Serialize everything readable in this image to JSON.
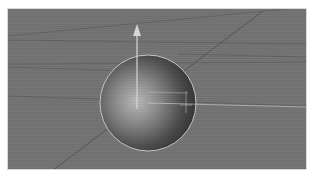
{
  "viewport": {
    "label": "3D Perspective Viewport",
    "background_color": "#737373",
    "grid_line_color": "#5f5f5f",
    "object": {
      "type": "sphere",
      "label": "Sphere",
      "center": [
        140,
        94
      ],
      "radius": 48,
      "highlight_color": "#b9b9b9",
      "shadow_color": "#3a3a3a",
      "outline_color": "#c8c8c8"
    },
    "gizmo": {
      "y_axis_color": "#d9d9d9",
      "x_axis_color": "#cfcfcf",
      "z_axis_color": "#545454"
    }
  }
}
